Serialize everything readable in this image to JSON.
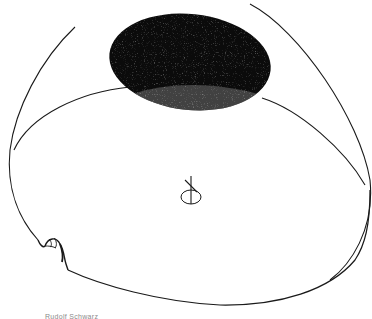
{
  "drawing": {
    "subject": "domed interior with dark oculus opening",
    "stroke_color": "#1a1a1a",
    "fill_dark": "#0b0b0b",
    "background": "#ffffff"
  },
  "caption": {
    "text": "Rudolf Schwarz"
  }
}
